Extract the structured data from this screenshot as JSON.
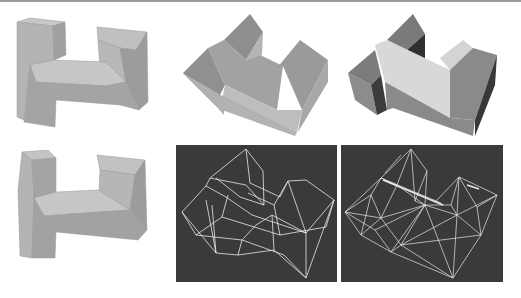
{
  "figure": {
    "colors": {
      "background": "#ffffff",
      "top_rule": "#9a9a9a",
      "wire_background": "#3a3a3a",
      "wire_stroke": "#e8e8e8",
      "shade_light": "#c8c8c8",
      "shade_mid": "#a8a8a8",
      "shade_dark": "#8c8c8c",
      "shade_darkest": "#4a4a4a",
      "shade_highlight": "#dcdcdc"
    },
    "panels": [
      {
        "id": "top-left",
        "kind": "shaded-front",
        "x": 10,
        "y": 10,
        "w": 150,
        "h": 125
      },
      {
        "id": "top-middle",
        "kind": "shaded-iso",
        "x": 180,
        "y": 10,
        "w": 160,
        "h": 130
      },
      {
        "id": "top-right",
        "kind": "shaded-iso-contrast",
        "x": 345,
        "y": 10,
        "w": 165,
        "h": 130
      },
      {
        "id": "bottom-left",
        "kind": "shaded-front",
        "x": 10,
        "y": 150,
        "w": 150,
        "h": 125
      },
      {
        "id": "bottom-middle",
        "kind": "wireframe-coarse",
        "x": 176,
        "y": 145,
        "w": 161,
        "h": 137
      },
      {
        "id": "bottom-right",
        "kind": "wireframe-dense",
        "x": 341,
        "y": 145,
        "w": 162,
        "h": 137
      }
    ]
  }
}
